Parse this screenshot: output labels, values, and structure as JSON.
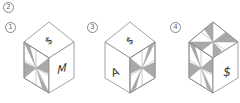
{
  "question": {
    "number_label": "2",
    "options": [
      {
        "label": "1",
        "top_symbol": "$",
        "left_face": "pinwheel",
        "right_face_symbol": "M"
      },
      {
        "label": "3",
        "top_symbol": "$",
        "left_face_symbol": "A",
        "right_face": "pinwheel"
      },
      {
        "label": "4",
        "top_face": "pinwheel",
        "left_face": "pinwheel",
        "right_face_symbol": "$"
      }
    ]
  },
  "colors": {
    "edge": "#8a8a8a",
    "shade": "#a9a9a9",
    "face": "#ffffff"
  }
}
